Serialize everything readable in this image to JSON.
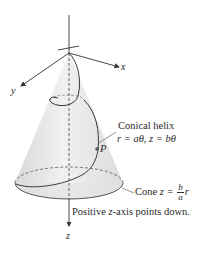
{
  "figure": {
    "title": "Conical helix",
    "axes": {
      "x_label": "x",
      "y_label": "y",
      "z_label": "z"
    },
    "helix": {
      "name": "Conical helix",
      "equation": "r = aθ, z = bθ",
      "point_label": "P"
    },
    "cone": {
      "prefix": "Cone",
      "equation_lhs": "z =",
      "fraction_numerator": "b",
      "fraction_denominator": "a",
      "equation_rhs": "r"
    },
    "note": "Positive z-axis points down.",
    "note_parts": {
      "before": "Positive ",
      "var": "z",
      "after": "-axis points down."
    },
    "colors": {
      "cone_fill": "#e6e6e6",
      "line": "#333333",
      "background": "#ffffff"
    }
  }
}
